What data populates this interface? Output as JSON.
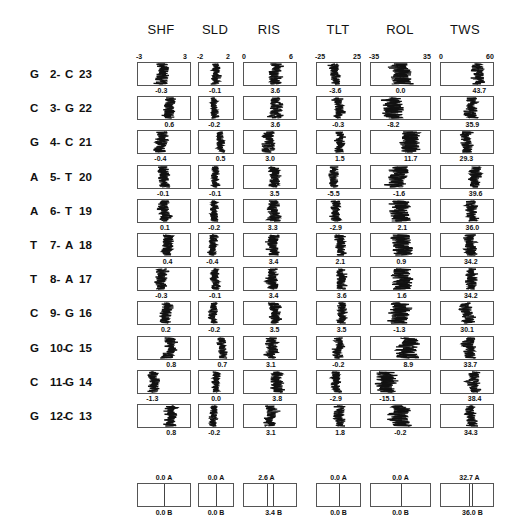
{
  "chart_data": {
    "type": "table",
    "title": "",
    "columns": [
      "SHF",
      "SLD",
      "RIS",
      "TLT",
      "ROL",
      "TWS"
    ],
    "axis_ranges": {
      "SHF": [
        -3,
        3
      ],
      "SLD": [
        -2,
        2
      ],
      "RIS": [
        0,
        6
      ],
      "TLT": [
        -25,
        25
      ],
      "ROL": [
        -35,
        35
      ],
      "TWS": [
        0,
        60
      ]
    },
    "axis_tick_labels": {
      "SHF": [
        "-3",
        "3"
      ],
      "SLD": [
        "-2",
        "2"
      ],
      "RIS": [
        "0",
        "6"
      ],
      "TLT": [
        "-25",
        "25"
      ],
      "ROL": [
        "-35",
        "35"
      ],
      "TWS": [
        "0",
        "60"
      ]
    },
    "rows": [
      {
        "label": [
          "G",
          "2-",
          "C",
          "23"
        ],
        "values": [
          -0.3,
          -0.1,
          3.6,
          -3.6,
          0.0,
          43.7
        ]
      },
      {
        "label": [
          "C",
          "3-",
          "G",
          "22"
        ],
        "values": [
          0.6,
          -0.2,
          3.6,
          -0.3,
          -8.2,
          35.9
        ]
      },
      {
        "label": [
          "G",
          "4-",
          "C",
          "21"
        ],
        "values": [
          -0.4,
          0.5,
          3.0,
          1.5,
          11.7,
          29.3
        ]
      },
      {
        "label": [
          "A",
          "5-",
          "T",
          "20"
        ],
        "values": [
          -0.1,
          -0.1,
          3.5,
          -5.5,
          -1.6,
          39.6
        ]
      },
      {
        "label": [
          "A",
          "6-",
          "T",
          "19"
        ],
        "values": [
          0.1,
          -0.2,
          3.3,
          -2.9,
          2.1,
          36.0
        ]
      },
      {
        "label": [
          "T",
          "7-",
          "A",
          "18"
        ],
        "values": [
          0.4,
          -0.4,
          3.4,
          2.1,
          0.9,
          34.2
        ]
      },
      {
        "label": [
          "T",
          "8-",
          "A",
          "17"
        ],
        "values": [
          -0.3,
          -0.1,
          3.4,
          3.6,
          1.6,
          34.2
        ]
      },
      {
        "label": [
          "C",
          "9-",
          "G",
          "16"
        ],
        "values": [
          0.2,
          -0.2,
          3.5,
          3.5,
          -1.3,
          30.1
        ]
      },
      {
        "label": [
          "G",
          "10-",
          "C",
          "15"
        ],
        "values": [
          0.8,
          0.7,
          3.1,
          -0.2,
          8.9,
          33.7
        ]
      },
      {
        "label": [
          "C",
          "11-",
          "G",
          "14"
        ],
        "values": [
          -1.3,
          0.0,
          3.8,
          -2.9,
          -15.1,
          38.4
        ]
      },
      {
        "label": [
          "G",
          "12-",
          "C",
          "13"
        ],
        "values": [
          0.8,
          -0.2,
          3.1,
          1.8,
          -0.2,
          34.3
        ]
      }
    ],
    "value_labels": [
      [
        "-0.3",
        "-0.1",
        "3.6",
        "-3.6",
        "0.0",
        "43.7"
      ],
      [
        "0.6",
        "-0.2",
        "3.6",
        "-0.3",
        "-8.2",
        "35.9"
      ],
      [
        "-0.4",
        "0.5",
        "3.0",
        "1.5",
        "11.7",
        "29.3"
      ],
      [
        "-0.1",
        "-0.1",
        "3.5",
        "-5.5",
        "-1.6",
        "39.6"
      ],
      [
        "0.1",
        "-0.2",
        "3.3",
        "-2.9",
        "2.1",
        "36.0"
      ],
      [
        "0.4",
        "-0.4",
        "3.4",
        "2.1",
        "0.9",
        "34.2"
      ],
      [
        "-0.3",
        "-0.1",
        "3.4",
        "3.6",
        "1.6",
        "34.2"
      ],
      [
        "0.2",
        "-0.2",
        "3.5",
        "3.5",
        "-1.3",
        "30.1"
      ],
      [
        "0.8",
        "0.7",
        "3.1",
        "-0.2",
        "8.9",
        "33.7"
      ],
      [
        "-1.3",
        "0.0",
        "3.8",
        "-2.9",
        "-15.1",
        "38.4"
      ],
      [
        "0.8",
        "-0.2",
        "3.1",
        "1.8",
        "-0.2",
        "34.3"
      ]
    ],
    "reference": {
      "A": [
        0.0,
        0.0,
        2.6,
        0.0,
        0.0,
        32.7
      ],
      "B": [
        0.0,
        0.0,
        3.4,
        0.0,
        0.0,
        36.0
      ],
      "labels_A": [
        "0.0 A",
        "0.0 A",
        "2.6 A",
        "0.0 A",
        "0.0 A",
        "32.7 A"
      ],
      "labels_B": [
        "0.0 B",
        "0.0 B",
        "3.4 B",
        "0.0 B",
        "0.0 B",
        "36.0 B"
      ]
    },
    "grid": false,
    "legend": null
  },
  "colors": {
    "trace": "#111111",
    "box_border": "#555555",
    "background": "#ffffff"
  }
}
